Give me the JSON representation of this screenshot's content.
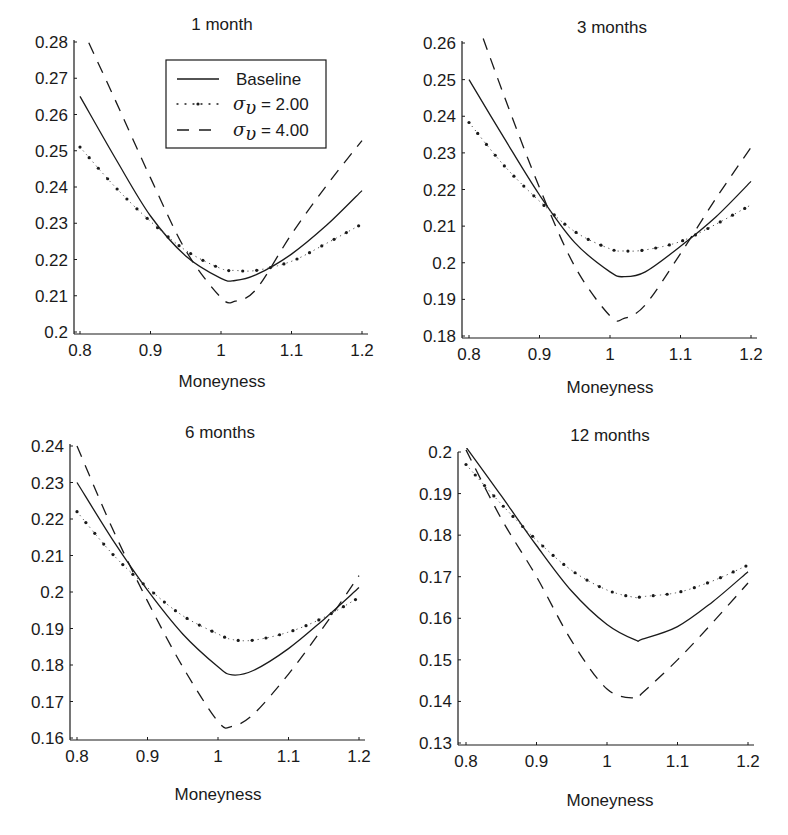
{
  "chart_data": [
    {
      "type": "line",
      "title": "1 month",
      "xlabel": "Moneyness",
      "ylabel": "",
      "xlim": [
        0.8,
        1.2
      ],
      "ylim": [
        0.2,
        0.28
      ],
      "xticks": [
        "0.8",
        "0.9",
        "1",
        "1.1",
        "1.2"
      ],
      "yticks": [
        "0.2",
        "0.21",
        "0.22",
        "0.23",
        "0.24",
        "0.25",
        "0.26",
        "0.27",
        "0.28"
      ],
      "grid": false,
      "legend": {
        "position": "upper right",
        "entries": [
          "Baseline",
          "σ_υ = 2.00",
          "σ_υ = 4.00"
        ]
      },
      "x": [
        0.8,
        0.85,
        0.9,
        0.95,
        1.0,
        1.02,
        1.05,
        1.1,
        1.15,
        1.2
      ],
      "series": [
        {
          "name": "Baseline",
          "style": "solid",
          "values": [
            0.265,
            0.248,
            0.232,
            0.221,
            0.2148,
            0.2142,
            0.2158,
            0.2215,
            0.2295,
            0.239
          ]
        },
        {
          "name": "σ_υ = 2.00",
          "style": "dotted",
          "values": [
            0.251,
            0.24,
            0.2305,
            0.2225,
            0.2175,
            0.217,
            0.217,
            0.2195,
            0.2245,
            0.2298
          ]
        },
        {
          "name": "σ_υ = 4.00",
          "style": "dashed",
          "values": [
            0.285,
            0.264,
            0.2425,
            0.2225,
            0.2095,
            0.2085,
            0.2118,
            0.227,
            0.2405,
            0.2528
          ]
        }
      ]
    },
    {
      "type": "line",
      "title": "3 months",
      "xlabel": "Moneyness",
      "ylabel": "",
      "xlim": [
        0.8,
        1.2
      ],
      "ylim": [
        0.18,
        0.26
      ],
      "xticks": [
        "0.8",
        "0.9",
        "1",
        "1.1",
        "1.2"
      ],
      "yticks": [
        "0.18",
        "0.19",
        "0.2",
        "0.21",
        "0.22",
        "0.23",
        "0.24",
        "0.25",
        "0.26"
      ],
      "grid": false,
      "x": [
        0.8,
        0.85,
        0.9,
        0.95,
        1.0,
        1.02,
        1.05,
        1.1,
        1.15,
        1.2
      ],
      "series": [
        {
          "name": "Baseline",
          "style": "solid",
          "values": [
            0.25,
            0.234,
            0.2185,
            0.2055,
            0.1975,
            0.1962,
            0.1975,
            0.2045,
            0.2125,
            0.2222
          ]
        },
        {
          "name": "σ_υ = 2.00",
          "style": "dotted",
          "values": [
            0.2383,
            0.2265,
            0.2168,
            0.2085,
            0.2038,
            0.2032,
            0.2035,
            0.2058,
            0.2105,
            0.2158
          ]
        },
        {
          "name": "σ_υ = 4.00",
          "style": "dashed",
          "values": [
            0.272,
            0.2455,
            0.2205,
            0.199,
            0.1855,
            0.1848,
            0.1885,
            0.2025,
            0.2175,
            0.2315
          ]
        }
      ]
    },
    {
      "type": "line",
      "title": "6 months",
      "xlabel": "Moneyness",
      "ylabel": "",
      "xlim": [
        0.8,
        1.2
      ],
      "ylim": [
        0.16,
        0.24
      ],
      "xticks": [
        "0.8",
        "0.9",
        "1",
        "1.1",
        "1.2"
      ],
      "yticks": [
        "0.16",
        "0.17",
        "0.18",
        "0.19",
        "0.2",
        "0.21",
        "0.22",
        "0.23",
        "0.24"
      ],
      "grid": false,
      "x": [
        0.8,
        0.85,
        0.9,
        0.95,
        1.0,
        1.02,
        1.05,
        1.1,
        1.15,
        1.2
      ],
      "series": [
        {
          "name": "Baseline",
          "style": "solid",
          "values": [
            0.23,
            0.2145,
            0.2005,
            0.1885,
            0.1795,
            0.1773,
            0.1785,
            0.1845,
            0.1925,
            0.2012
          ]
        },
        {
          "name": "σ_υ = 2.00",
          "style": "dotted",
          "values": [
            0.222,
            0.2105,
            0.2012,
            0.1935,
            0.1885,
            0.187,
            0.1868,
            0.189,
            0.193,
            0.1985
          ]
        },
        {
          "name": "σ_υ = 4.00",
          "style": "dashed",
          "values": [
            0.24,
            0.2175,
            0.1975,
            0.1795,
            0.1645,
            0.1632,
            0.1665,
            0.1775,
            0.1905,
            0.2045
          ]
        }
      ]
    },
    {
      "type": "line",
      "title": "12 months",
      "xlabel": "Moneyness",
      "ylabel": "",
      "xlim": [
        0.8,
        1.2
      ],
      "ylim": [
        0.13,
        0.208
      ],
      "xticks": [
        "0.8",
        "0.9",
        "1",
        "1.1",
        "1.2"
      ],
      "yticks": [
        "0.13",
        "0.14",
        "0.15",
        "0.16",
        "0.17",
        "0.18",
        "0.19",
        "0.2"
      ],
      "grid": false,
      "x": [
        0.8,
        0.85,
        0.9,
        0.95,
        1.0,
        1.04,
        1.05,
        1.1,
        1.15,
        1.2
      ],
      "series": [
        {
          "name": "Baseline",
          "style": "solid",
          "values": [
            0.2012,
            0.1895,
            0.1775,
            0.1665,
            0.1585,
            0.1548,
            0.155,
            0.158,
            0.164,
            0.1712
          ]
        },
        {
          "name": "σ_υ = 2.00",
          "style": "dotted",
          "values": [
            0.197,
            0.1875,
            0.1788,
            0.1715,
            0.1668,
            0.165,
            0.1652,
            0.1662,
            0.169,
            0.1728
          ]
        },
        {
          "name": "σ_υ = 4.00",
          "style": "dashed",
          "values": [
            0.2005,
            0.184,
            0.17,
            0.1545,
            0.143,
            0.1408,
            0.142,
            0.15,
            0.159,
            0.1685
          ]
        }
      ]
    }
  ],
  "panels": [
    {
      "title": "1 month",
      "xlabel": "Moneyness"
    },
    {
      "title": "3 months",
      "xlabel": "Moneyness"
    },
    {
      "title": "6 months",
      "xlabel": "Moneyness"
    },
    {
      "title": "12 months",
      "xlabel": "Moneyness"
    }
  ],
  "legend": {
    "baseline": "Baseline",
    "s2_symbol": "σ",
    "s2_sub": "υ",
    "s2_value": " = 2.00",
    "s4_symbol": "σ",
    "s4_sub": "υ",
    "s4_value": " = 4.00"
  },
  "colors": {
    "line": "#1a1a1a",
    "axis": "#1a1a1a",
    "background": "#ffffff"
  }
}
